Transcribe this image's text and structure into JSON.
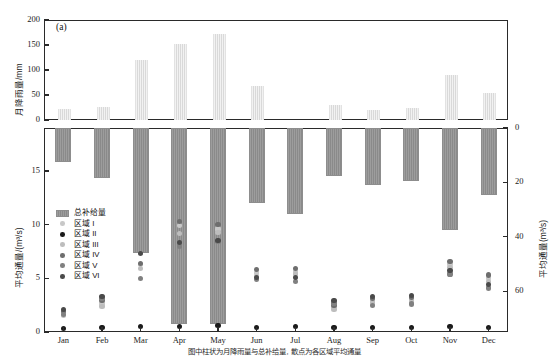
{
  "figure": {
    "caption": "图中柱状为月降雨量与总补给量, 散点为各区域平均通量"
  },
  "panel_a": {
    "tag": "(a)",
    "ylabel": "月降雨量/mm",
    "yticks": [
      "0",
      "50",
      "100",
      "150",
      "200"
    ]
  },
  "panel_b": {
    "tag": "(b)",
    "ylabel_left": "平均通量/(m³/s)",
    "ylabel_right": "平均通量(m³/s)",
    "yticks_left": [
      "0",
      "5",
      "10",
      "15"
    ],
    "yticks_right": [
      "0",
      "20",
      "40",
      "60"
    ],
    "legend": [
      {
        "label": "总补给量",
        "marker": "bar-swatch",
        "color": "#939393"
      },
      {
        "label": "区域 I",
        "marker": "circle",
        "color": "#c8c8c8"
      },
      {
        "label": "区域 II",
        "marker": "circle",
        "color": "#1a1a1a"
      },
      {
        "label": "区域 III",
        "marker": "circle",
        "color": "#bdbdbd"
      },
      {
        "label": "区域 IV",
        "marker": "circle",
        "color": "#6e6e6e"
      },
      {
        "label": "区域 V",
        "marker": "circle",
        "color": "#808080"
      },
      {
        "label": "区域 VI",
        "marker": "circle",
        "color": "#4a4a4a"
      }
    ]
  },
  "chart_data": [
    {
      "type": "bar",
      "panel": "(a)",
      "title": "",
      "xlabel": "",
      "ylabel": "月降雨量/mm",
      "ylim": [
        0,
        200
      ],
      "grid": false,
      "categories": [
        "Jan",
        "Feb",
        "Mar",
        "Apr",
        "May",
        "Jun",
        "Jul",
        "Aug",
        "Sep",
        "Oct",
        "Nov",
        "Dec"
      ],
      "series": [
        {
          "name": "月降雨量",
          "values": [
            22,
            27,
            120,
            153,
            172,
            68,
            0,
            31,
            21,
            24,
            90,
            55
          ]
        }
      ]
    },
    {
      "type": "bar",
      "panel": "(b)",
      "title": "",
      "xlabel": "",
      "ylabel": "平均通量(m³/s)",
      "ylim": [
        0,
        75
      ],
      "y_inverted": true,
      "grid": false,
      "categories": [
        "Jan",
        "Feb",
        "Mar",
        "Apr",
        "May",
        "Jun",
        "Jul",
        "Aug",
        "Sep",
        "Oct",
        "Nov",
        "Dec"
      ],
      "series": [
        {
          "name": "总补给量",
          "values": [
            12.5,
            18.5,
            46.0,
            72.0,
            72.0,
            27.5,
            31.5,
            17.5,
            21.0,
            19.5,
            37.5,
            24.5
          ]
        }
      ]
    },
    {
      "type": "scatter",
      "panel": "(b)",
      "title": "",
      "xlabel": "",
      "ylabel": "平均通量/(m³/s)",
      "ylim": [
        0,
        19
      ],
      "grid": false,
      "categories": [
        "Jan",
        "Feb",
        "Mar",
        "Apr",
        "May",
        "Jun",
        "Jul",
        "Aug",
        "Sep",
        "Oct",
        "Nov",
        "Dec"
      ],
      "series": [
        {
          "name": "区域 I",
          "color": "#c8c8c8",
          "values": [
            1.7,
            2.6,
            6.3,
            9.9,
            9.6,
            5.5,
            5.6,
            2.3,
            2.9,
            3.0,
            6.3,
            5.0
          ]
        },
        {
          "name": "区域 II",
          "color": "#1a1a1a",
          "values": [
            0.3,
            0.4,
            0.5,
            0.5,
            0.6,
            0.4,
            0.5,
            0.4,
            0.4,
            0.4,
            0.5,
            0.4
          ]
        },
        {
          "name": "区域 III",
          "color": "#bdbdbd",
          "values": [
            1.5,
            2.4,
            5.9,
            9.2,
            9.3,
            5.2,
            5.4,
            2.1,
            2.7,
            2.8,
            6.0,
            4.7
          ]
        },
        {
          "name": "区域 IV",
          "color": "#6e6e6e",
          "values": [
            1.9,
            2.9,
            6.4,
            10.3,
            10.0,
            5.8,
            5.9,
            2.5,
            3.1,
            3.2,
            6.6,
            5.3
          ]
        },
        {
          "name": "区域 V",
          "color": "#808080",
          "values": [
            1.6,
            3.1,
            5.0,
            8.0,
            8.4,
            4.9,
            4.7,
            2.7,
            2.5,
            2.6,
            5.4,
            4.1
          ]
        },
        {
          "name": "区域 VI",
          "color": "#4a4a4a",
          "values": [
            2.1,
            3.3,
            7.3,
            8.3,
            8.5,
            5.1,
            5.1,
            2.9,
            3.3,
            3.4,
            5.7,
            4.4
          ]
        }
      ]
    }
  ]
}
